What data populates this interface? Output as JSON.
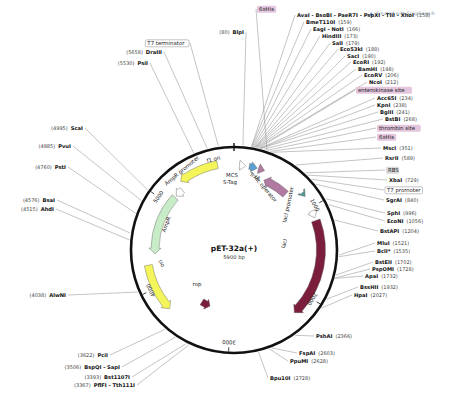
{
  "watermark": {
    "icon": "snapgene-logo-icon",
    "text": "Created with SnapGene®"
  },
  "plasmid": {
    "name": "pET-32a(+)",
    "length_label": "5900 bp",
    "length": 5900
  },
  "ticks": [
    {
      "label": "1000",
      "pos": 1000
    },
    {
      "label": "2000",
      "pos": 2000
    },
    {
      "label": "3000",
      "pos": 3000
    },
    {
      "label": "4000",
      "pos": 4000
    },
    {
      "label": "5000",
      "pos": 5000
    }
  ],
  "features": [
    {
      "name": "f1 ori",
      "color": "#f4f55a"
    },
    {
      "name": "AmpR promoter",
      "color": "#ffffff"
    },
    {
      "name": "AmpR",
      "color": "#c8ecc8"
    },
    {
      "name": "ori",
      "color": "#f4f55a"
    },
    {
      "name": "rop",
      "color": "#7a1e3c"
    },
    {
      "name": "lacI",
      "color": "#7a1e3c"
    },
    {
      "name": "lacI promoter",
      "color": "#ffffff"
    },
    {
      "name": "TrxA",
      "color": "#b07aa1"
    },
    {
      "name": "lac operator",
      "color": "#4f9a9a"
    },
    {
      "name": "MCS",
      "color": "#ffffff"
    },
    {
      "name": "S-Tag",
      "color": "#5aa0d0"
    }
  ],
  "labels_right": [
    {
      "name": "6xHis",
      "pos": "",
      "kind": "feature-box"
    },
    {
      "name": "AvaI - BsoBI - PaeR7I - PspXI - TliI - XhoI",
      "pos": "(158)"
    },
    {
      "name": "BmeT110I",
      "pos": "(159)"
    },
    {
      "name": "EagI - NotI",
      "pos": "(166)"
    },
    {
      "name": "HindIII",
      "pos": "(173)"
    },
    {
      "name": "SalI",
      "pos": "(179)"
    },
    {
      "name": "Eco53kI",
      "pos": "(188)"
    },
    {
      "name": "SacI",
      "pos": "(190)"
    },
    {
      "name": "EcoRI",
      "pos": "(192)"
    },
    {
      "name": "BamHI",
      "pos": "(198)"
    },
    {
      "name": "EcoRV",
      "pos": "(206)"
    },
    {
      "name": "NcoI",
      "pos": "(212)"
    },
    {
      "name": "enterokinase site",
      "pos": "",
      "kind": "feature-box"
    },
    {
      "name": "Acc65I",
      "pos": "(234)"
    },
    {
      "name": "KpnI",
      "pos": "(238)"
    },
    {
      "name": "BglII",
      "pos": "(241)"
    },
    {
      "name": "BstBI",
      "pos": "(268)"
    },
    {
      "name": "thrombin site",
      "pos": "",
      "kind": "feature-box"
    },
    {
      "name": "6xHis",
      "pos": "",
      "kind": "feature-box"
    },
    {
      "name": "MscI",
      "pos": "(351)"
    },
    {
      "name": "RsrII",
      "pos": "(589)"
    },
    {
      "name": "RBS",
      "pos": "",
      "kind": "feature-box-gray"
    },
    {
      "name": "XbaI",
      "pos": "(729)"
    },
    {
      "name": "T7 promoter",
      "pos": "",
      "kind": "feature-box-white"
    },
    {
      "name": "SgrAI",
      "pos": "(840)"
    },
    {
      "name": "SphI",
      "pos": "(996)"
    },
    {
      "name": "EcoNI",
      "pos": "(1056)"
    },
    {
      "name": "BstAPI",
      "pos": "(1204)"
    },
    {
      "name": "MluI",
      "pos": "(1521)"
    },
    {
      "name": "BclI*",
      "pos": "(1535)"
    },
    {
      "name": "BstEII",
      "pos": "(1702)"
    },
    {
      "name": "PspOMI",
      "pos": "(1728)"
    },
    {
      "name": "ApaI",
      "pos": "(1732)"
    },
    {
      "name": "BssHII",
      "pos": "(1932)"
    },
    {
      "name": "HpaI",
      "pos": "(2027)"
    },
    {
      "name": "PshAI",
      "pos": "(2366)"
    },
    {
      "name": "FspAI",
      "pos": "(2603)"
    },
    {
      "name": "PpuMI",
      "pos": "(2628)"
    },
    {
      "name": "Bpu10I",
      "pos": "(2728)"
    }
  ],
  "labels_left": [
    {
      "name": "BlpI",
      "pos": "(80)"
    },
    {
      "name": "T7 terminator",
      "pos": "",
      "kind": "feature-box-white"
    },
    {
      "name": "DraIII",
      "pos": "(5658)"
    },
    {
      "name": "PsiI",
      "pos": "(5530)"
    },
    {
      "name": "ScaI",
      "pos": "(4995)"
    },
    {
      "name": "PvuI",
      "pos": "(4885)"
    },
    {
      "name": "PstI",
      "pos": "(4760)"
    },
    {
      "name": "BsaI",
      "pos": "(4576)"
    },
    {
      "name": "AhdI",
      "pos": "(4515)"
    },
    {
      "name": "AlwNI",
      "pos": "(4038)"
    },
    {
      "name": "PciI",
      "pos": "(3622)"
    },
    {
      "name": "BspQI - SapI",
      "pos": "(3506)"
    },
    {
      "name": "Bst1107I",
      "pos": "(3393)"
    },
    {
      "name": "PflFI - Tth111I",
      "pos": "(3367)"
    }
  ],
  "colors": {
    "backbone": "#111111",
    "leader": "#888888",
    "feature_box_purple": "#e3c6dd",
    "feature_box_gray": "#d9d9d9"
  }
}
